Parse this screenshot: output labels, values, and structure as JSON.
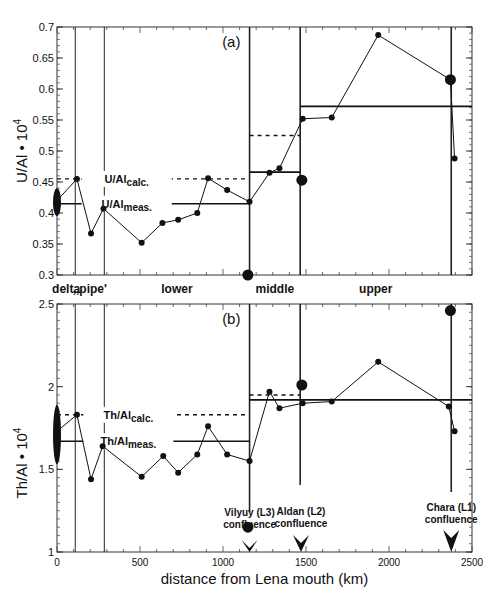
{
  "chart_data": [
    {
      "id": "a",
      "type": "line",
      "panel_label": "(a)",
      "ylabel": "U/Al • 10",
      "ylabel_sup": "4",
      "xlabel": "distance from Lena mouth (km)",
      "ylim": [
        0.3,
        0.7
      ],
      "yticks": [
        0.3,
        0.35,
        0.4,
        0.45,
        0.5,
        0.55,
        0.6,
        0.65,
        0.7
      ],
      "ytick_labels": [
        "0.3",
        "0.35",
        "0.4",
        "0.45",
        "0.5",
        "0.55",
        "0.6",
        "0.65",
        "0.7"
      ],
      "xlim": [
        0,
        2500
      ],
      "series": [
        {
          "name": "U/Al profile",
          "x": [
            0,
            120,
            205,
            280,
            510,
            635,
            730,
            845,
            910,
            1025,
            1160,
            1280,
            1340,
            1480,
            1655,
            1935,
            2370,
            2395
          ],
          "y": [
            0.42,
            0.455,
            0.367,
            0.407,
            0.352,
            0.384,
            0.389,
            0.4,
            0.456,
            0.437,
            0.418,
            0.465,
            0.472,
            0.552,
            0.554,
            0.687,
            0.615,
            0.488
          ]
        }
      ],
      "tributaries": [
        {
          "name": "Vilyuy (L3)",
          "x": 1150,
          "y": 0.3
        },
        {
          "name": "Aldan (L2)",
          "x": 1475,
          "y": 0.453
        },
        {
          "name": "Chara (L1)",
          "x": 2370,
          "y": 0.615
        }
      ],
      "delta_range": [
        0.395,
        0.44
      ],
      "measured_lines": [
        {
          "x0": 0,
          "x1": 1160,
          "y": 0.415
        },
        {
          "x0": 1160,
          "x1": 1465,
          "y": 0.466
        },
        {
          "x0": 1465,
          "x1": 2500,
          "y": 0.572
        }
      ],
      "calculated_lines": [
        {
          "x0": 0,
          "x1": 1160,
          "y": 0.455
        },
        {
          "x0": 1160,
          "x1": 1465,
          "y": 0.525
        }
      ],
      "calc_label": {
        "main": "U/Al",
        "sub": "calc.",
        "x": 420,
        "y": 0.455
      },
      "meas_label": {
        "main": "U/Al",
        "sub": "meas.",
        "x": 420,
        "y": 0.415
      }
    },
    {
      "id": "b",
      "type": "line",
      "panel_label": "(b)",
      "ylabel": "Th/Al • 10",
      "ylabel_sup": "4",
      "xlabel": "distance from Lena mouth (km)",
      "ylim": [
        1.0,
        2.5
      ],
      "yticks": [
        1.0,
        1.5,
        2.0,
        2.5
      ],
      "ytick_labels": [
        "1",
        "1.5",
        "2",
        "2.5"
      ],
      "xlim": [
        0,
        2500
      ],
      "xticks": [
        0,
        500,
        1000,
        1500,
        2000,
        2500
      ],
      "xtick_labels": [
        "0",
        "500",
        "1000",
        "1500",
        "2000",
        "2500"
      ],
      "series": [
        {
          "name": "Th/Al profile",
          "x": [
            0,
            120,
            205,
            275,
            510,
            640,
            730,
            845,
            910,
            1025,
            1160,
            1280,
            1340,
            1480,
            1655,
            1935,
            2360,
            2395
          ],
          "y": [
            1.73,
            1.83,
            1.44,
            1.64,
            1.455,
            1.58,
            1.48,
            1.59,
            1.76,
            1.59,
            1.55,
            1.97,
            1.87,
            1.9,
            1.91,
            2.15,
            1.88,
            1.73
          ]
        }
      ],
      "tributaries": [
        {
          "name": "Vilyuy (L3)",
          "x": 1150,
          "y": 1.15
        },
        {
          "name": "Aldan (L2)",
          "x": 1475,
          "y": 2.01
        },
        {
          "name": "Chara (L1)",
          "x": 2370,
          "y": 2.46
        }
      ],
      "delta_range": [
        1.53,
        1.89
      ],
      "measured_lines": [
        {
          "x0": 0,
          "x1": 1160,
          "y": 1.67
        },
        {
          "x0": 1160,
          "x1": 1465,
          "y": 1.92
        },
        {
          "x0": 1465,
          "x1": 2500,
          "y": 1.92
        }
      ],
      "calculated_lines": [
        {
          "x0": 0,
          "x1": 1160,
          "y": 1.83
        },
        {
          "x0": 1160,
          "x1": 1465,
          "y": 1.95
        }
      ],
      "calc_label": {
        "main": "Th/Al",
        "sub": "calc.",
        "x": 430,
        "y": 1.83
      },
      "meas_label": {
        "main": "Th/Al",
        "sub": "meas.",
        "x": 430,
        "y": 1.67
      }
    }
  ],
  "sections": [
    {
      "label": "delta",
      "x_from": 0,
      "x_to": 110
    },
    {
      "label": ",,pipe'",
      "x_from": 110,
      "x_to": 285
    },
    {
      "label": "lower",
      "x_from": 285,
      "x_to": 1160
    },
    {
      "label": "middle",
      "x_from": 1160,
      "x_to": 1465
    },
    {
      "label": "upper",
      "x_from": 1465,
      "x_to": 2375
    }
  ],
  "boundaries_km": [
    110,
    285,
    1160,
    1465,
    2375
  ],
  "confluences": [
    {
      "line1": "Vilyuy (L3)",
      "line2": "confluence",
      "x": 1160
    },
    {
      "line1": "Aldan (L2)",
      "line2": "confluence",
      "x": 1470
    },
    {
      "line1": "Chara (L1)",
      "line2": "confluence",
      "x": 2375
    }
  ],
  "xaxis": {
    "label": "distance from Lena mouth (km)",
    "ticks": [
      "0",
      "500",
      "1000",
      "1500",
      "2000",
      "2500"
    ]
  }
}
